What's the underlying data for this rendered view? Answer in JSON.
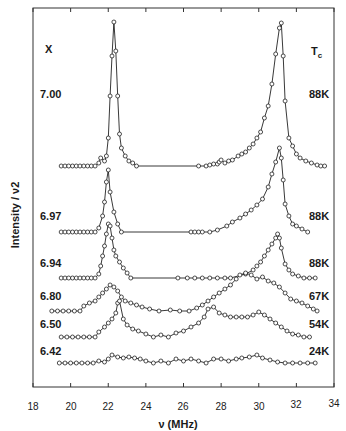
{
  "chart_data": {
    "type": "line",
    "title": "",
    "xlabel": "ν (MHz)",
    "ylabel": "Intensity / ν2",
    "xlim": [
      18,
      34
    ],
    "xticks": [
      18,
      20,
      22,
      24,
      26,
      28,
      30,
      32,
      34
    ],
    "grid": false,
    "left_column_header": "X",
    "right_column_header": "Tc",
    "series": [
      {
        "name": "7.00",
        "tc": "88K",
        "baseline_px": 166,
        "points": [
          [
            19.5,
            0
          ],
          [
            19.7,
            0
          ],
          [
            19.9,
            0
          ],
          [
            20.1,
            0
          ],
          [
            20.3,
            0
          ],
          [
            20.5,
            0
          ],
          [
            20.7,
            0
          ],
          [
            20.9,
            0
          ],
          [
            21.1,
            0
          ],
          [
            21.3,
            0
          ],
          [
            21.5,
            3
          ],
          [
            21.6,
            8
          ],
          [
            21.8,
            5
          ],
          [
            21.9,
            10
          ],
          [
            22.0,
            28
          ],
          [
            22.1,
            70
          ],
          [
            22.2,
            110
          ],
          [
            22.3,
            144
          ],
          [
            22.4,
            115
          ],
          [
            22.5,
            70
          ],
          [
            22.6,
            32
          ],
          [
            22.7,
            18
          ],
          [
            22.9,
            10
          ],
          [
            23.1,
            5
          ],
          [
            23.3,
            3
          ],
          [
            23.5,
            0
          ],
          [
            26.8,
            0
          ],
          [
            27.2,
            0
          ],
          [
            27.4,
            1
          ],
          [
            27.6,
            2
          ],
          [
            27.8,
            2
          ],
          [
            27.9,
            4
          ],
          [
            28.0,
            6
          ],
          [
            28.2,
            3
          ],
          [
            28.4,
            5
          ],
          [
            28.6,
            6
          ],
          [
            28.9,
            10
          ],
          [
            29.1,
            12
          ],
          [
            29.3,
            14
          ],
          [
            29.5,
            18
          ],
          [
            29.7,
            22
          ],
          [
            29.9,
            28
          ],
          [
            30.1,
            34
          ],
          [
            30.3,
            48
          ],
          [
            30.5,
            60
          ],
          [
            30.7,
            82
          ],
          [
            30.9,
            112
          ],
          [
            31.1,
            138
          ],
          [
            31.2,
            143
          ],
          [
            31.3,
            110
          ],
          [
            31.4,
            65
          ],
          [
            31.6,
            28
          ],
          [
            31.8,
            20
          ],
          [
            32.0,
            12
          ],
          [
            32.2,
            8
          ],
          [
            32.5,
            5
          ],
          [
            32.8,
            3
          ],
          [
            33.1,
            1
          ],
          [
            33.3,
            0
          ],
          [
            33.5,
            0
          ]
        ]
      },
      {
        "name": "6.97",
        "tc": "88K",
        "baseline_px": 232,
        "points": [
          [
            19.5,
            0
          ],
          [
            19.7,
            0
          ],
          [
            19.9,
            0
          ],
          [
            20.1,
            0
          ],
          [
            20.3,
            0
          ],
          [
            20.5,
            0
          ],
          [
            20.7,
            0
          ],
          [
            20.9,
            0
          ],
          [
            21.1,
            0
          ],
          [
            21.3,
            0
          ],
          [
            21.5,
            4
          ],
          [
            21.7,
            16
          ],
          [
            21.8,
            30
          ],
          [
            21.9,
            50
          ],
          [
            22.0,
            62
          ],
          [
            22.1,
            40
          ],
          [
            22.3,
            20
          ],
          [
            22.5,
            8
          ],
          [
            22.7,
            0
          ],
          [
            26.4,
            0
          ],
          [
            26.6,
            0
          ],
          [
            26.8,
            0
          ],
          [
            27.0,
            0
          ],
          [
            27.4,
            0
          ],
          [
            27.8,
            2
          ],
          [
            28.3,
            6
          ],
          [
            28.6,
            10
          ],
          [
            29.0,
            14
          ],
          [
            29.3,
            18
          ],
          [
            29.6,
            22
          ],
          [
            29.9,
            27
          ],
          [
            30.2,
            33
          ],
          [
            30.5,
            45
          ],
          [
            30.7,
            58
          ],
          [
            30.9,
            70
          ],
          [
            31.1,
            84
          ],
          [
            31.2,
            74
          ],
          [
            31.3,
            52
          ],
          [
            31.4,
            28
          ],
          [
            31.6,
            16
          ],
          [
            31.8,
            8
          ],
          [
            32.0,
            6
          ],
          [
            32.3,
            3
          ],
          [
            32.6,
            0
          ]
        ]
      },
      {
        "name": "6.94",
        "tc": "88K",
        "baseline_px": 278,
        "points": [
          [
            19.5,
            0
          ],
          [
            19.7,
            0
          ],
          [
            19.9,
            0
          ],
          [
            20.1,
            0
          ],
          [
            20.3,
            0
          ],
          [
            20.5,
            0
          ],
          [
            20.7,
            0
          ],
          [
            20.9,
            0
          ],
          [
            21.1,
            0
          ],
          [
            21.3,
            0
          ],
          [
            21.5,
            4
          ],
          [
            21.6,
            12
          ],
          [
            21.7,
            22
          ],
          [
            21.8,
            32
          ],
          [
            21.9,
            44
          ],
          [
            22.0,
            54
          ],
          [
            22.1,
            52
          ],
          [
            22.2,
            40
          ],
          [
            22.3,
            28
          ],
          [
            22.4,
            22
          ],
          [
            22.6,
            16
          ],
          [
            22.8,
            10
          ],
          [
            23.0,
            5
          ],
          [
            23.2,
            0
          ],
          [
            25.7,
            0
          ],
          [
            26.2,
            0
          ],
          [
            26.6,
            0
          ],
          [
            27.0,
            0
          ],
          [
            27.4,
            0
          ],
          [
            27.8,
            0
          ],
          [
            28.2,
            0
          ],
          [
            28.5,
            0
          ],
          [
            29.3,
            4
          ],
          [
            29.7,
            8
          ],
          [
            29.9,
            12
          ],
          [
            30.1,
            16
          ],
          [
            30.3,
            22
          ],
          [
            30.5,
            28
          ],
          [
            30.7,
            34
          ],
          [
            30.9,
            40
          ],
          [
            31.0,
            44
          ],
          [
            31.1,
            40
          ],
          [
            31.2,
            30
          ],
          [
            31.4,
            14
          ],
          [
            31.6,
            8
          ],
          [
            31.8,
            4
          ],
          [
            32.1,
            2
          ],
          [
            32.4,
            0
          ],
          [
            32.7,
            0
          ],
          [
            33.0,
            0
          ]
        ]
      },
      {
        "name": "6.80",
        "tc": "67K",
        "baseline_px": 311,
        "points": [
          [
            19.0,
            0
          ],
          [
            19.3,
            0
          ],
          [
            19.6,
            0
          ],
          [
            19.9,
            0
          ],
          [
            20.2,
            0
          ],
          [
            20.5,
            0
          ],
          [
            20.7,
            5
          ],
          [
            21.0,
            8
          ],
          [
            21.3,
            10
          ],
          [
            21.5,
            14
          ],
          [
            21.7,
            18
          ],
          [
            21.9,
            22
          ],
          [
            22.1,
            26
          ],
          [
            22.3,
            24
          ],
          [
            22.5,
            20
          ],
          [
            22.7,
            14
          ],
          [
            22.9,
            10
          ],
          [
            23.2,
            8
          ],
          [
            23.5,
            6
          ],
          [
            23.8,
            4
          ],
          [
            24.2,
            2
          ],
          [
            24.7,
            0
          ],
          [
            25.3,
            1
          ],
          [
            25.8,
            0
          ],
          [
            26.3,
            0
          ],
          [
            26.7,
            3
          ],
          [
            27.0,
            6
          ],
          [
            27.3,
            10
          ],
          [
            27.6,
            14
          ],
          [
            27.9,
            18
          ],
          [
            28.2,
            22
          ],
          [
            28.5,
            26
          ],
          [
            28.8,
            32
          ],
          [
            29.0,
            36
          ],
          [
            29.3,
            38
          ],
          [
            29.6,
            36
          ],
          [
            29.9,
            32
          ],
          [
            30.2,
            34
          ],
          [
            30.5,
            30
          ],
          [
            30.8,
            28
          ],
          [
            31.1,
            24
          ],
          [
            31.4,
            18
          ],
          [
            31.7,
            12
          ],
          [
            32.0,
            10
          ],
          [
            32.3,
            8
          ],
          [
            32.6,
            5
          ],
          [
            32.9,
            2
          ],
          [
            33.1,
            0
          ]
        ]
      },
      {
        "name": "6.50",
        "tc": "54K",
        "baseline_px": 337,
        "points": [
          [
            19.5,
            0
          ],
          [
            19.8,
            0
          ],
          [
            20.1,
            0
          ],
          [
            20.4,
            0
          ],
          [
            20.7,
            0
          ],
          [
            21.0,
            0
          ],
          [
            21.3,
            0
          ],
          [
            21.5,
            5
          ],
          [
            21.8,
            10
          ],
          [
            22.0,
            14
          ],
          [
            22.2,
            18
          ],
          [
            22.4,
            24
          ],
          [
            22.5,
            34
          ],
          [
            22.6,
            36
          ],
          [
            22.8,
            18
          ],
          [
            23.0,
            12
          ],
          [
            23.3,
            8
          ],
          [
            23.6,
            6
          ],
          [
            24.0,
            3
          ],
          [
            24.4,
            0
          ],
          [
            24.8,
            2
          ],
          [
            25.2,
            0
          ],
          [
            25.6,
            4
          ],
          [
            26.0,
            6
          ],
          [
            26.4,
            10
          ],
          [
            26.8,
            14
          ],
          [
            27.1,
            20
          ],
          [
            27.3,
            28
          ],
          [
            27.6,
            30
          ],
          [
            27.9,
            24
          ],
          [
            28.2,
            22
          ],
          [
            28.5,
            20
          ],
          [
            28.8,
            20
          ],
          [
            29.1,
            20
          ],
          [
            29.4,
            20
          ],
          [
            29.7,
            22
          ],
          [
            30.0,
            25
          ],
          [
            30.3,
            22
          ],
          [
            30.6,
            18
          ],
          [
            30.9,
            14
          ],
          [
            31.2,
            10
          ],
          [
            31.5,
            6
          ],
          [
            31.8,
            3
          ],
          [
            32.1,
            2
          ],
          [
            32.4,
            0
          ],
          [
            32.7,
            0
          ]
        ]
      },
      {
        "name": "6.42",
        "tc": "24K",
        "baseline_px": 363,
        "points": [
          [
            19.4,
            0
          ],
          [
            19.7,
            0
          ],
          [
            20.0,
            0
          ],
          [
            20.3,
            0
          ],
          [
            20.6,
            0
          ],
          [
            20.9,
            0
          ],
          [
            21.2,
            0
          ],
          [
            21.5,
            2
          ],
          [
            21.8,
            1
          ],
          [
            22.0,
            4
          ],
          [
            22.2,
            8
          ],
          [
            22.5,
            6
          ],
          [
            22.8,
            5
          ],
          [
            23.1,
            6
          ],
          [
            23.4,
            5
          ],
          [
            23.7,
            4
          ],
          [
            24.0,
            2
          ],
          [
            24.4,
            0
          ],
          [
            24.8,
            2
          ],
          [
            25.2,
            0
          ],
          [
            25.6,
            4
          ],
          [
            26.0,
            2
          ],
          [
            26.4,
            4
          ],
          [
            26.8,
            2
          ],
          [
            27.2,
            0
          ],
          [
            27.6,
            4
          ],
          [
            28.0,
            4
          ],
          [
            28.4,
            2
          ],
          [
            28.8,
            4
          ],
          [
            29.1,
            5
          ],
          [
            29.5,
            6
          ],
          [
            29.9,
            8
          ],
          [
            30.2,
            5
          ],
          [
            30.6,
            3
          ],
          [
            31.0,
            1
          ],
          [
            31.4,
            0
          ],
          [
            31.8,
            0
          ],
          [
            32.2,
            0
          ],
          [
            32.6,
            0
          ],
          [
            33.0,
            0
          ]
        ]
      }
    ]
  },
  "labels": {
    "left_header": "X",
    "right_header_main": "T",
    "right_header_sub": "c",
    "ylabel": "Intensity / ν2",
    "xlabel": "ν  (MHz)"
  },
  "rows": [
    {
      "x": "7.00",
      "tc": "88K"
    },
    {
      "x": "6.97",
      "tc": "88K"
    },
    {
      "x": "6.94",
      "tc": "88K"
    },
    {
      "x": "6.80",
      "tc": "67K"
    },
    {
      "x": "6.50",
      "tc": "54K"
    },
    {
      "x": "6.42",
      "tc": "24K"
    }
  ],
  "ticks": [
    "18",
    "20",
    "22",
    "24",
    "26",
    "28",
    "30",
    "32",
    "34"
  ]
}
